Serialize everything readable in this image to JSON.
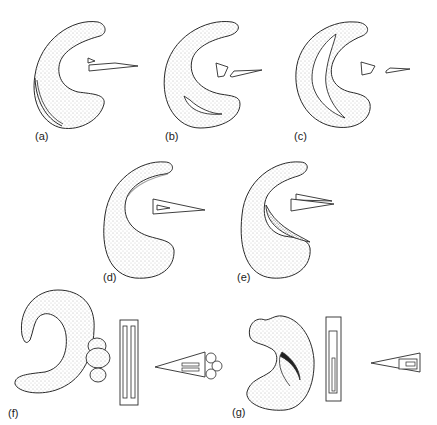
{
  "figure": {
    "panels": [
      {
        "id": "a",
        "label": "(a)"
      },
      {
        "id": "b",
        "label": "(b)"
      },
      {
        "id": "c",
        "label": "(c)"
      },
      {
        "id": "d",
        "label": "(d)"
      },
      {
        "id": "e",
        "label": "(e)"
      },
      {
        "id": "f",
        "label": "(f)"
      },
      {
        "id": "g",
        "label": "(g)"
      }
    ],
    "colors": {
      "stroke": "#2a2a2a",
      "fill": "#ffffff",
      "stipple": "#555555"
    }
  }
}
